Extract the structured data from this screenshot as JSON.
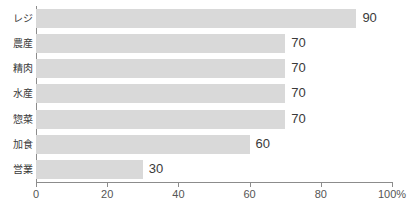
{
  "chart_data": {
    "type": "bar",
    "orientation": "horizontal",
    "title": "",
    "subtitle": "",
    "xlabel": "",
    "ylabel": "",
    "xlim": [
      0,
      100
    ],
    "grid": false,
    "legend": false,
    "bar_color": "#d9d9d9",
    "axis_color": "#8c8c8c",
    "categories": [
      "レジ",
      "農産",
      "精肉",
      "水産",
      "惣菜",
      "加食",
      "営業"
    ],
    "values": [
      90,
      70,
      70,
      70,
      70,
      60,
      30
    ],
    "value_labels": [
      "90",
      "70",
      "70",
      "70",
      "70",
      "60",
      "30"
    ],
    "xticks": [
      0,
      20,
      40,
      60,
      80,
      100
    ],
    "xtick_labels": [
      "0",
      "20",
      "40",
      "60",
      "80",
      "100%"
    ]
  }
}
